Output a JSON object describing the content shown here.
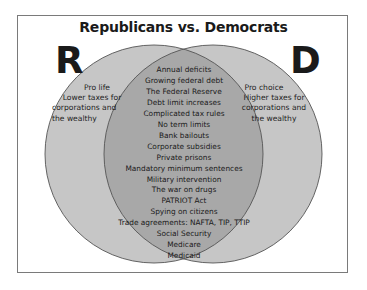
{
  "title": "Republicans vs. Democrats",
  "left_set": {
    "letter": "R",
    "label": "Republicans",
    "items": [
      "Pro life",
      "Lower taxes for",
      "corporations and",
      "the wealthy"
    ]
  },
  "right_set": {
    "letter": "D",
    "label": "Democrats",
    "items": [
      "Pro choice",
      "Higher taxes for",
      "corporations and",
      "the wealthy"
    ]
  },
  "intersection": {
    "items": [
      "Annual deficits",
      "Growing federal debt",
      "The Federal Reserve",
      "Debt limit increases",
      "Complicated tax rules",
      "No term limits",
      "Bank bailouts",
      "Corporate subsidies",
      "Private prisons",
      "Mandatory minimum sentences",
      "Military intervention",
      "The war on drugs",
      "PATRIOT Act",
      "Spying on citizens",
      "Trade agreements: NAFTA, TIP, TTIP",
      "Social Security",
      "Medicare",
      "Medicaid"
    ]
  },
  "colors": {
    "background": "#ffffff",
    "frame_border": "#7a7a7a",
    "circle_fill": "#c6c6c6",
    "circle_stroke": "#555555",
    "intersection_fill": "#a8a8a8",
    "text": "#1a1a1a"
  }
}
